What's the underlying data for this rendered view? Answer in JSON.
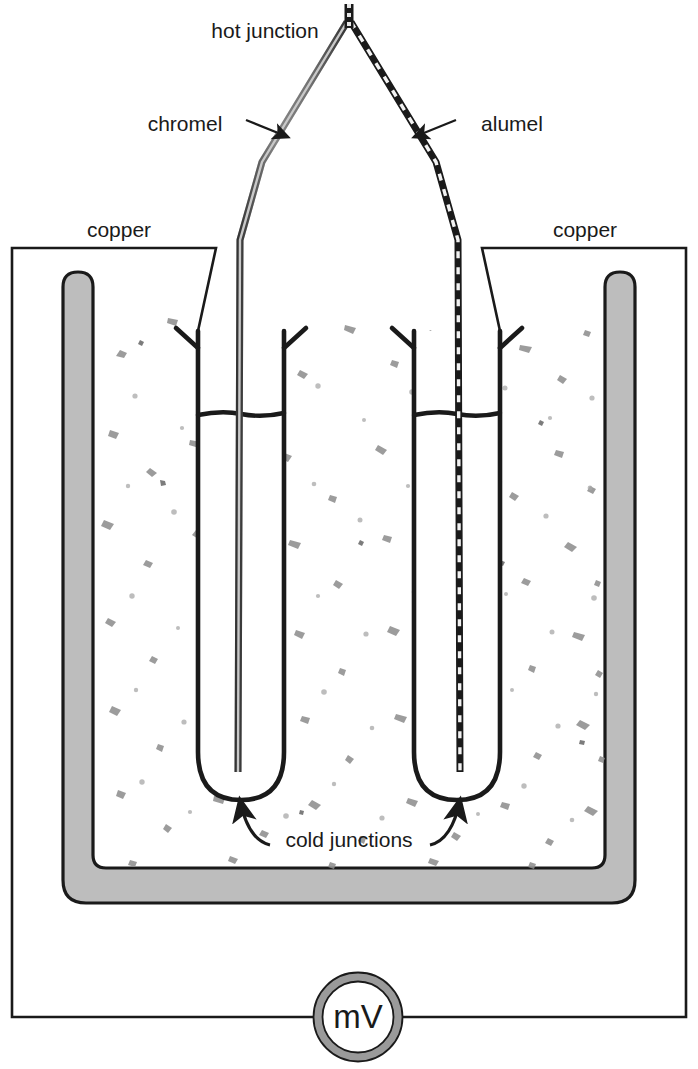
{
  "figure": {
    "type": "schematic-diagram"
  },
  "labels": {
    "hot_junction": "hot junction",
    "chromel": "chromel",
    "alumel": "alumel",
    "copper_left": "copper",
    "copper_right": "copper",
    "cold_junctions": "cold junctions",
    "meter": "mV"
  },
  "colors": {
    "stroke": "#1a1a1a",
    "wire_chromel": "#7a7a7a",
    "wire_alumel_dark": "#1a1a1a",
    "wire_alumel_light": "#e8e8e8",
    "vessel_fill": "#bdbdbd",
    "vessel_stroke": "#1a1a1a",
    "ice_speckle": "#8a8a8a",
    "meter_ring": "#9a9a9a",
    "background": "#ffffff"
  },
  "components": {
    "thermocouple": {
      "name": "thermocouple",
      "legs": [
        "chromel",
        "alumel"
      ],
      "junction": "hot junction"
    },
    "ice_bath": {
      "name": "ice bath vessel",
      "contents": "crushed ice and water",
      "wall_style": "thick rounded gray"
    },
    "test_tubes": {
      "count": 2,
      "contents": "cold junctions immersed"
    },
    "meter": {
      "name": "millivoltmeter",
      "symbol": "mV",
      "shape": "circle"
    },
    "copper_leads": {
      "count": 2,
      "label": "copper",
      "connects": "cold junctions to millivoltmeter"
    }
  }
}
